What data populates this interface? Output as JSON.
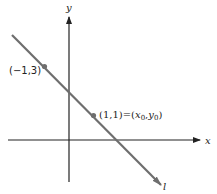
{
  "diagram": {
    "axes": {
      "x_label": "x",
      "y_label": "y",
      "color": "#222222"
    },
    "line": {
      "label": "l",
      "color": "#6e6e6e",
      "slope": -1,
      "intercept": 2
    },
    "points": [
      {
        "label": "(−1,3)",
        "x": -1,
        "y": 3,
        "color": "#6e6e6e"
      },
      {
        "label": "(1,1)=(",
        "x": 1,
        "y": 1,
        "color": "#6e6e6e",
        "eq_x": "x",
        "eq_x_sub": "0",
        "eq_sep": ",",
        "eq_y": "y",
        "eq_y_sub": "0",
        "eq_close": ")"
      }
    ]
  }
}
